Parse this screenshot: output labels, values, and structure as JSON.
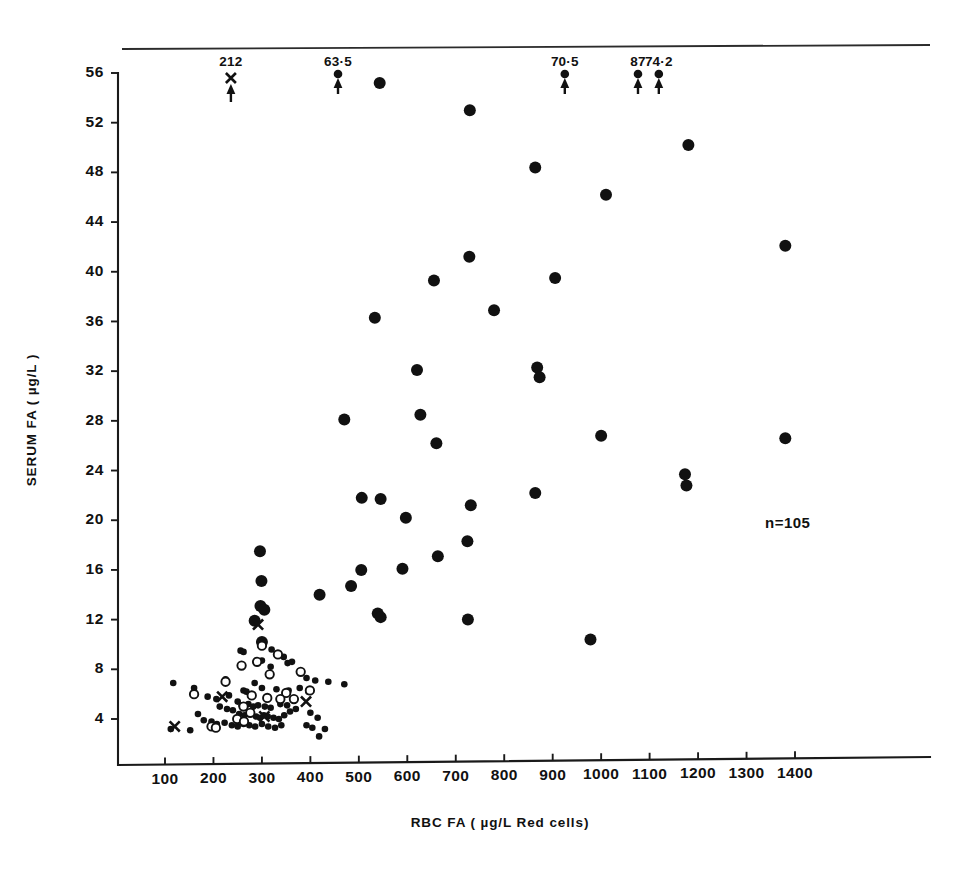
{
  "figure": {
    "background": "#ffffff",
    "ink": "#111111",
    "n_label": "n=105"
  },
  "chart_data": {
    "type": "scatter",
    "title": "",
    "subtitle": "",
    "xlabel": "RBC  FA ( µg/L  Red cells)",
    "ylabel": "SERUM  FA ( µg/L )",
    "xlim": [
      35,
      1460
    ],
    "ylim": [
      1.2,
      57.6
    ],
    "xticks": [
      100,
      200,
      300,
      400,
      500,
      600,
      700,
      800,
      900,
      1000,
      1100,
      1200,
      1300,
      1400
    ],
    "xticklabels": [
      "100",
      "200",
      "300",
      "400",
      "500",
      "600",
      "700",
      "800",
      "900",
      "1000",
      "1100",
      "1200",
      "1300",
      "1400"
    ],
    "yticks": [
      4,
      8,
      12,
      16,
      20,
      24,
      28,
      32,
      36,
      40,
      44,
      48,
      52,
      56
    ],
    "yticklabels": [
      "4",
      "8",
      "12",
      "16",
      "20",
      "24",
      "28",
      "32",
      "36",
      "40",
      "44",
      "48",
      "52",
      "56"
    ],
    "grid": false,
    "legend": "none",
    "n": 105,
    "annotations": [
      {
        "text": "n=105",
        "x": 1120,
        "y": 20.8,
        "kind": "count"
      }
    ],
    "offscale_arrows": [
      {
        "label": "212",
        "x": 236,
        "marker": "x",
        "y_offscale": 212.0
      },
      {
        "label": "63·5",
        "x": 457,
        "marker": "circle",
        "y_offscale": 63.5
      },
      {
        "label": "70·5",
        "x": 925,
        "marker": "circle",
        "y_offscale": 70.5
      },
      {
        "label": "87",
        "x": 1076,
        "marker": "circle",
        "y_offscale": 87.0
      },
      {
        "label": "74·2",
        "x": 1119,
        "marker": "circle",
        "y_offscale": 74.2
      }
    ],
    "series": [
      {
        "name": "filled-large",
        "marker": "filled-circle",
        "marker_size": 6.0,
        "points": [
          [
            543,
            55.2
          ],
          [
            729,
            53.0
          ],
          [
            864,
            48.4
          ],
          [
            1180,
            50.2
          ],
          [
            1010,
            46.2
          ],
          [
            1380,
            42.1
          ],
          [
            728,
            41.2
          ],
          [
            655,
            39.3
          ],
          [
            905,
            39.5
          ],
          [
            779,
            36.9
          ],
          [
            533,
            36.3
          ],
          [
            620,
            32.1
          ],
          [
            868,
            32.3
          ],
          [
            873,
            31.5
          ],
          [
            627,
            28.5
          ],
          [
            470,
            28.1
          ],
          [
            1000,
            26.8
          ],
          [
            1380,
            26.6
          ],
          [
            660,
            26.2
          ],
          [
            1173,
            23.7
          ],
          [
            1176,
            22.8
          ],
          [
            864,
            22.2
          ],
          [
            731,
            21.2
          ],
          [
            597,
            20.2
          ],
          [
            506,
            21.8
          ],
          [
            545,
            21.7
          ],
          [
            724,
            18.3
          ],
          [
            663,
            17.1
          ],
          [
            590,
            16.1
          ],
          [
            505,
            16.0
          ],
          [
            296,
            17.5
          ],
          [
            299,
            15.1
          ],
          [
            484,
            14.7
          ],
          [
            419,
            14.0
          ],
          [
            297,
            13.1
          ],
          [
            305,
            12.8
          ],
          [
            539,
            12.5
          ],
          [
            545,
            12.2
          ],
          [
            725,
            12.0
          ],
          [
            978,
            10.4
          ],
          [
            285,
            11.9
          ],
          [
            300,
            10.2
          ]
        ]
      },
      {
        "name": "filled-small",
        "marker": "filled-circle",
        "marker_size": 3.3,
        "points": [
          [
            320,
            9.6
          ],
          [
            345,
            9.0
          ],
          [
            300,
            8.7
          ],
          [
            318,
            8.2
          ],
          [
            353,
            8.5
          ],
          [
            362,
            8.6
          ],
          [
            256,
            9.5
          ],
          [
            262,
            9.4
          ],
          [
            470,
            6.8
          ],
          [
            437,
            7.0
          ],
          [
            392,
            7.3
          ],
          [
            410,
            7.1
          ],
          [
            225,
            7.2
          ],
          [
            117,
            6.9
          ],
          [
            160,
            6.5
          ],
          [
            285,
            6.9
          ],
          [
            262,
            6.3
          ],
          [
            268,
            6.2
          ],
          [
            300,
            6.5
          ],
          [
            330,
            6.4
          ],
          [
            355,
            6.3
          ],
          [
            378,
            6.5
          ],
          [
            396,
            6.2
          ],
          [
            188,
            5.8
          ],
          [
            206,
            5.6
          ],
          [
            232,
            5.9
          ],
          [
            250,
            5.4
          ],
          [
            258,
            5.1
          ],
          [
            272,
            5.2
          ],
          [
            282,
            5.0
          ],
          [
            292,
            5.1
          ],
          [
            306,
            5.0
          ],
          [
            318,
            4.9
          ],
          [
            338,
            5.2
          ],
          [
            352,
            5.1
          ],
          [
            370,
            4.8
          ],
          [
            213,
            5.0
          ],
          [
            228,
            4.8
          ],
          [
            240,
            4.7
          ],
          [
            253,
            4.4
          ],
          [
            264,
            4.3
          ],
          [
            276,
            4.4
          ],
          [
            288,
            4.2
          ],
          [
            296,
            4.1
          ],
          [
            304,
            4.3
          ],
          [
            312,
            4.2
          ],
          [
            324,
            4.1
          ],
          [
            335,
            4.0
          ],
          [
            346,
            4.3
          ],
          [
            358,
            4.6
          ],
          [
            400,
            4.5
          ],
          [
            415,
            4.1
          ],
          [
            168,
            4.4
          ],
          [
            180,
            3.9
          ],
          [
            196,
            3.8
          ],
          [
            207,
            3.6
          ],
          [
            223,
            3.7
          ],
          [
            238,
            3.5
          ],
          [
            250,
            3.4
          ],
          [
            262,
            3.6
          ],
          [
            274,
            3.5
          ],
          [
            286,
            3.4
          ],
          [
            300,
            3.6
          ],
          [
            313,
            3.4
          ],
          [
            327,
            3.3
          ],
          [
            340,
            3.5
          ],
          [
            392,
            3.5
          ],
          [
            404,
            3.3
          ],
          [
            418,
            2.6
          ],
          [
            112,
            3.2
          ],
          [
            152,
            3.1
          ],
          [
            430,
            3.2
          ]
        ]
      },
      {
        "name": "open-circle",
        "marker": "open-circle",
        "marker_size": 4.2,
        "points": [
          [
            300,
            9.9
          ],
          [
            333,
            9.2
          ],
          [
            258,
            8.3
          ],
          [
            290,
            8.6
          ],
          [
            380,
            7.8
          ],
          [
            316,
            7.6
          ],
          [
            225,
            7.0
          ],
          [
            160,
            6.0
          ],
          [
            350,
            6.1
          ],
          [
            399,
            6.3
          ],
          [
            338,
            5.6
          ],
          [
            366,
            5.6
          ],
          [
            311,
            5.7
          ],
          [
            279,
            5.9
          ],
          [
            262,
            5.0
          ],
          [
            276,
            4.5
          ],
          [
            249,
            4.0
          ],
          [
            263,
            3.8
          ],
          [
            196,
            3.4
          ],
          [
            205,
            3.3
          ]
        ]
      },
      {
        "name": "cross",
        "marker": "x",
        "marker_size": 6.5,
        "points": [
          [
            292,
            11.6
          ],
          [
            218,
            5.8
          ],
          [
            391,
            5.4
          ],
          [
            305,
            4.2
          ],
          [
            120,
            3.4
          ]
        ]
      }
    ]
  }
}
